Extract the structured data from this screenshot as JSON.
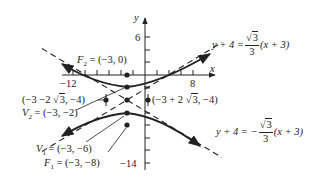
{
  "diagram": {
    "type": "hyperbola",
    "axes": {
      "x_label": "x",
      "y_label": "y",
      "tick_labels": {
        "x_neg": "−12",
        "x_pos": "8",
        "y_pos": "6",
        "y_neg": "−14"
      }
    },
    "points": {
      "F2": {
        "name": "F",
        "sub": "2",
        "coord": "= (−3, 0)"
      },
      "V2": {
        "name": "V",
        "sub": "2",
        "coord": "= (−3, −2)"
      },
      "V1": {
        "name": "V",
        "sub": "1",
        "coord": "= (−3, −6)"
      },
      "F1": {
        "name": "F",
        "sub": "1",
        "coord": "= (−3, −8)"
      },
      "left_point": {
        "text_a": "(−3 −2 ",
        "sqrt": "3",
        "text_b": ", −4)"
      },
      "right_point": {
        "text_a": "(−3 + 2 ",
        "sqrt": "3",
        "text_b": ", −4)"
      }
    },
    "asymptotes": {
      "positive": {
        "lhs": "y + 4 =",
        "sign": "",
        "num_sqrt": "3",
        "den": "3",
        "rhs": "(x + 3)"
      },
      "negative": {
        "lhs": "y + 4 = −",
        "sign": "−",
        "num_sqrt": "3",
        "den": "3",
        "rhs": "(x + 3)"
      }
    },
    "colors": {
      "ink": "#222222",
      "background": "#ffffff"
    }
  }
}
